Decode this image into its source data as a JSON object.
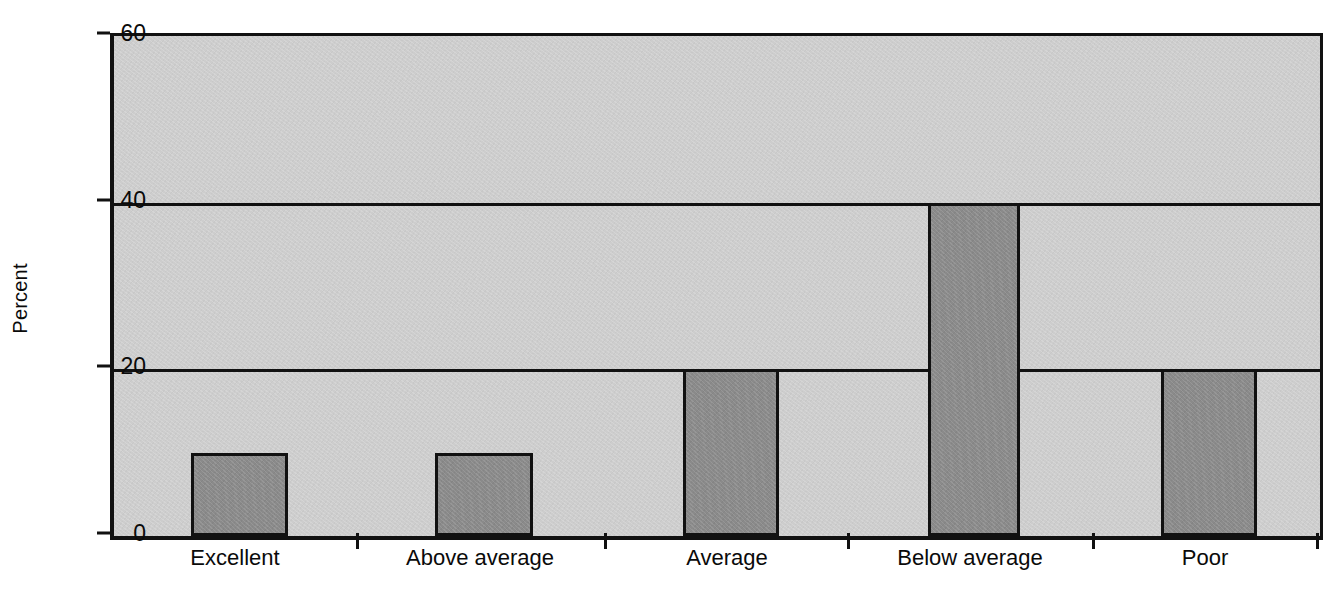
{
  "chart_data": {
    "type": "bar",
    "title": "",
    "subtitle": "",
    "xlabel": "",
    "ylabel": "Percent",
    "categories": [
      "Excellent",
      "Above average",
      "Average",
      "Below average",
      "Poor"
    ],
    "values": [
      10,
      10,
      20,
      40,
      20
    ],
    "ylim": [
      0,
      60
    ],
    "yticks": [
      0,
      20,
      40,
      60
    ],
    "ytick_labels": [
      "0",
      "20",
      "40",
      "60"
    ],
    "gridlines": [
      20,
      40
    ],
    "grid": true,
    "legend": false,
    "legend_position": "none",
    "annotations": [],
    "colors": {
      "bar_fill": "#8a8a8a",
      "bar_stroke": "#111111",
      "plot_background": "#cdcdcd",
      "axis": "#111111",
      "text": "#0a0a0a",
      "figure_background": "#ffffff"
    }
  }
}
